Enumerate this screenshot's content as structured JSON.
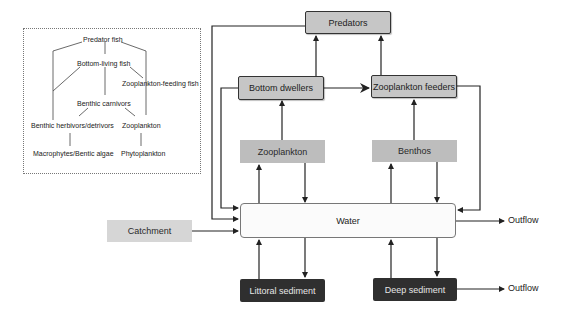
{
  "legend": {
    "predator_fish": "Predator fish",
    "bottom_living_fish": "Bottom-living fish",
    "zooplankton_feeding_fish": "Zooplankton-feeding fish",
    "benthic_carnivors": "Benthic carnivors",
    "benthic_herbivors": "Benthic herbivors/detrivors",
    "zooplankton": "Zooplankton",
    "macrophytes": "Macrophytes/Bentic algae",
    "phytoplankton": "Phytoplankton"
  },
  "nodes": {
    "predators": "Predators",
    "bottom_dwellers": "Bottom dwellers",
    "zooplankton_feeders": "Zooplankton feeders",
    "zooplankton": "Zooplankton",
    "benthos": "Benthos",
    "water": "Water",
    "catchment": "Catchment",
    "littoral_sediment": "Littoral sediment",
    "deep_sediment": "Deep sediment",
    "outflow_water": "Outflow",
    "outflow_sediment": "Outflow"
  },
  "colors": {
    "line": "#222222",
    "consumer_box": "#c6c6c6",
    "plankton_box": "#bdbdbd",
    "catchment_box": "#d6d6d6",
    "sediment_box": "#2f2f2f",
    "water_box": "#fbfbfb"
  }
}
